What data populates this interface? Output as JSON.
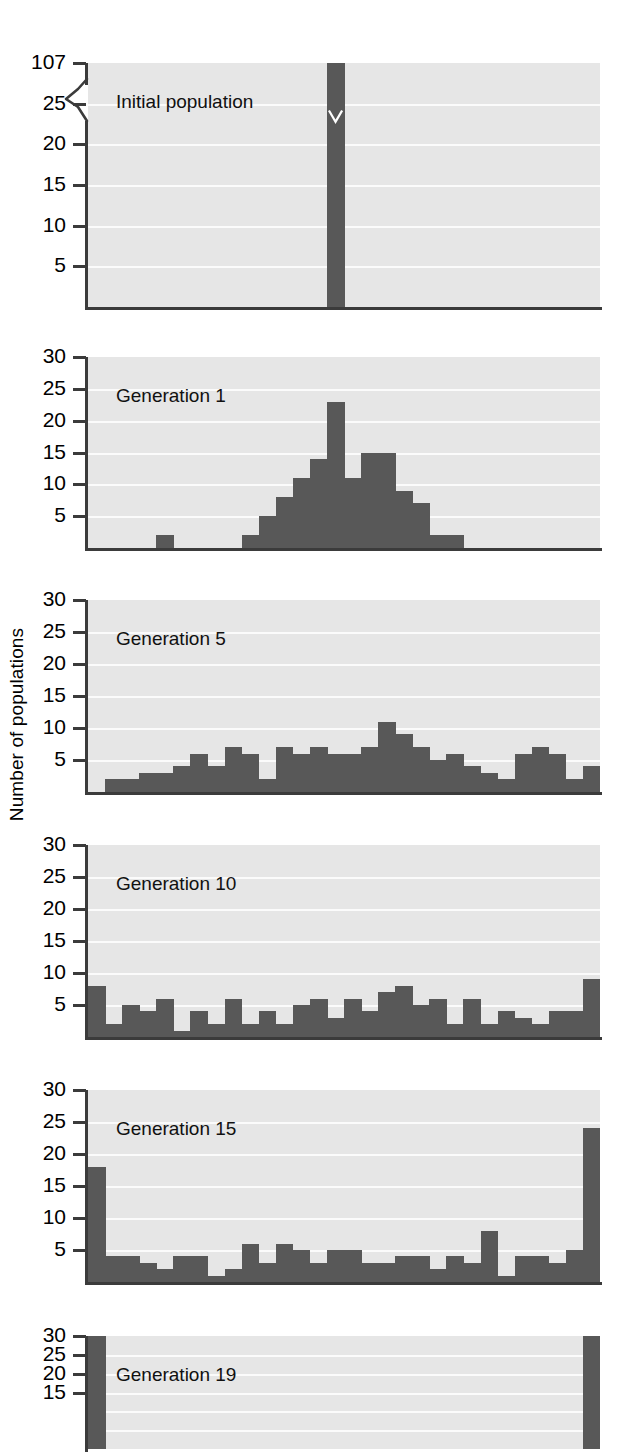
{
  "axis": {
    "y_title": "Number of populations"
  },
  "chart_data": {
    "type": "bar",
    "title": "",
    "xlabel": "",
    "ylabel": "Number of populations",
    "grid": true,
    "legend": "none",
    "nbins": 30,
    "panels": [
      {
        "label": "Initial population",
        "ylim": [
          0,
          30
        ],
        "yticks": [
          5,
          10,
          15,
          20,
          25,
          107
        ],
        "ytick_labels": [
          "5",
          "10",
          "15",
          "20",
          "25",
          "107"
        ],
        "axis_break": true,
        "axis_break_between": [
          25,
          107
        ],
        "note": "single bar at bin 14 with value 107, drawn clipped with break mark",
        "values": [
          0,
          0,
          0,
          0,
          0,
          0,
          0,
          0,
          0,
          0,
          0,
          0,
          0,
          0,
          107,
          0,
          0,
          0,
          0,
          0,
          0,
          0,
          0,
          0,
          0,
          0,
          0,
          0,
          0,
          0
        ]
      },
      {
        "label": "Generation 1",
        "ylim": [
          0,
          30
        ],
        "yticks": [
          5,
          10,
          15,
          20,
          25,
          30
        ],
        "ytick_labels": [
          "5",
          "10",
          "15",
          "20",
          "25",
          "30"
        ],
        "axis_break": false,
        "values": [
          0,
          0,
          0,
          0,
          2,
          0,
          0,
          0,
          0,
          2,
          5,
          8,
          11,
          14,
          23,
          11,
          15,
          15,
          9,
          7,
          2,
          2,
          0,
          0,
          0,
          0,
          0,
          0,
          0,
          0
        ]
      },
      {
        "label": "Generation 5",
        "ylim": [
          0,
          30
        ],
        "yticks": [
          5,
          10,
          15,
          20,
          25,
          30
        ],
        "ytick_labels": [
          "5",
          "10",
          "15",
          "20",
          "25",
          "30"
        ],
        "axis_break": false,
        "values": [
          0,
          2,
          2,
          3,
          3,
          4,
          6,
          4,
          7,
          6,
          2,
          7,
          6,
          7,
          6,
          6,
          7,
          11,
          9,
          7,
          5,
          6,
          4,
          3,
          2,
          6,
          7,
          6,
          2,
          4
        ]
      },
      {
        "label": "Generation 10",
        "ylim": [
          0,
          30
        ],
        "yticks": [
          5,
          10,
          15,
          20,
          25,
          30
        ],
        "ytick_labels": [
          "5",
          "10",
          "15",
          "20",
          "25",
          "30"
        ],
        "axis_break": false,
        "values": [
          8,
          2,
          5,
          4,
          6,
          1,
          4,
          2,
          6,
          2,
          4,
          2,
          5,
          6,
          3,
          6,
          4,
          7,
          8,
          5,
          6,
          2,
          6,
          2,
          4,
          3,
          2,
          4,
          4,
          9
        ]
      },
      {
        "label": "Generation 15",
        "ylim": [
          0,
          30
        ],
        "yticks": [
          5,
          10,
          15,
          20,
          25,
          30
        ],
        "ytick_labels": [
          "5",
          "10",
          "15",
          "20",
          "25",
          "30"
        ],
        "axis_break": false,
        "values": [
          18,
          4,
          4,
          3,
          2,
          4,
          4,
          1,
          2,
          6,
          3,
          6,
          5,
          3,
          5,
          5,
          3,
          3,
          4,
          4,
          2,
          4,
          3,
          8,
          1,
          4,
          4,
          3,
          5,
          24
        ]
      },
      {
        "label": "Generation 19",
        "ylim": [
          0,
          30
        ],
        "yticks": [
          15,
          20,
          25,
          30
        ],
        "ytick_labels": [
          "15",
          "20",
          "25",
          "30"
        ],
        "axis_break": false,
        "clipped": true,
        "values": [
          30,
          0,
          0,
          0,
          0,
          0,
          0,
          0,
          0,
          0,
          0,
          0,
          0,
          0,
          0,
          0,
          0,
          0,
          0,
          0,
          0,
          0,
          0,
          0,
          0,
          0,
          0,
          0,
          0,
          30
        ]
      }
    ]
  },
  "colors": {
    "bar": "#585858",
    "plot_background": "#e6e6e6",
    "gridline": "#fbfbfb",
    "axis": "#3b3b3b",
    "text": "#000000"
  }
}
